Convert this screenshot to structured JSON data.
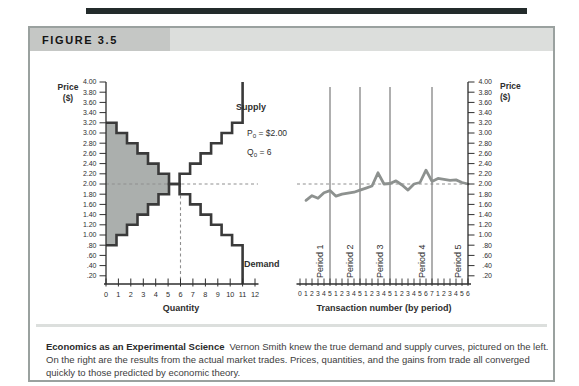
{
  "figure": {
    "label": "FIGURE 3.5",
    "caption_title": "Economics as an Experimental Science",
    "caption_body": "Vernon Smith knew the true demand and supply curves, pictured on the left. On the right are the results from the actual market trades. Prices, quantities, and the gains from trade all converged quickly to those predicted by economic theory."
  },
  "colors": {
    "top_bar": "#232b2b",
    "box_border": "#9aa19f",
    "tab_bg": "#c5c7c5",
    "header_bg": "#dcdedc",
    "surplus_fill": "#abafad",
    "curve": "#3a3a3a",
    "price_line": "#8d918f",
    "dashed": "#8f8f8f",
    "separator": "#7a7a7a",
    "axis": "#2f2f2f"
  },
  "chart_data": [
    {
      "type": "line",
      "subtype": "step-supply-demand",
      "panel": "left",
      "xlabel": "Quantity",
      "ylabel": "Price ($)",
      "xlim": [
        0,
        12
      ],
      "ylim": [
        0.2,
        4.0
      ],
      "grid": false,
      "xtick_labels": [
        "0",
        "1",
        "2",
        "3",
        "4",
        "5",
        "6",
        "7",
        "8",
        "9",
        "10",
        "11",
        "12"
      ],
      "ytick_labels": [
        "4.00",
        "3.80",
        "3.60",
        "3.40",
        "3.20",
        "3.00",
        "2.80",
        "2.60",
        "2.40",
        "2.20",
        "2.00",
        "1.80",
        "1.60",
        "1.40",
        "1.20",
        "1.00",
        ".80",
        ".60",
        ".40",
        ".20"
      ],
      "series": [
        {
          "name": "Demand",
          "style": "step",
          "x_start": 0,
          "x_end": 11,
          "unit_prices": [
            3.2,
            3.0,
            2.8,
            2.6,
            2.4,
            2.2,
            2.0,
            1.8,
            1.6,
            1.4,
            1.2,
            1.0,
            0.8
          ]
        },
        {
          "name": "Supply",
          "style": "step",
          "x_start": 0,
          "x_end": 11,
          "unit_prices": [
            0.8,
            1.0,
            1.2,
            1.4,
            1.6,
            1.8,
            2.0,
            2.2,
            2.4,
            2.6,
            2.8,
            3.0,
            3.2
          ]
        }
      ],
      "equilibrium": {
        "price": 2.0,
        "quantity": 6
      },
      "annotations": {
        "supply_label": "Supply",
        "demand_label": "Demand",
        "p0": {
          "base": "P",
          "sub": "0",
          "rest": " = $2.00"
        },
        "q0": {
          "base": "Q",
          "sub": "0",
          "rest": " = 6"
        }
      }
    },
    {
      "type": "line",
      "subtype": "transaction-prices",
      "panel": "right",
      "xlabel": "Transaction number (by period)",
      "ylabel": "Price ($)",
      "ylim": [
        0.2,
        4.0
      ],
      "equilibrium_price": 2.0,
      "ytick_labels": [
        "4.00",
        "3.80",
        "3.60",
        "3.40",
        "3.20",
        "3.00",
        "2.80",
        "2.60",
        "2.40",
        "2.20",
        "2.00",
        "1.80",
        "1.60",
        "1.40",
        "1.20",
        "1.00",
        ".80",
        ".60",
        ".40",
        ".20"
      ],
      "periods": [
        {
          "label": "Period 1",
          "tick_labels": [
            "0",
            "1",
            "2",
            "3",
            "4",
            "5"
          ],
          "prices": [
            1.68,
            1.77,
            1.72,
            1.83,
            1.87
          ]
        },
        {
          "label": "Period 2",
          "tick_labels": [
            "1",
            "2",
            "3",
            "4",
            "5"
          ],
          "prices": [
            1.76,
            1.8,
            1.82,
            1.84,
            1.88
          ]
        },
        {
          "label": "Period 3",
          "tick_labels": [
            "1",
            "2",
            "3",
            "4",
            "5"
          ],
          "prices": [
            1.92,
            1.96,
            2.22,
            2.0,
            2.01
          ]
        },
        {
          "label": "Period 4",
          "tick_labels": [
            "1",
            "2",
            "3",
            "4",
            "5",
            "6",
            "7"
          ],
          "prices": [
            2.06,
            1.98,
            1.88,
            2.0,
            2.03,
            2.27,
            2.05
          ]
        },
        {
          "label": "Period 5",
          "tick_labels": [
            "1",
            "2",
            "3",
            "4",
            "5",
            "6"
          ],
          "prices": [
            2.11,
            2.09,
            2.07,
            2.08,
            2.03,
            2.0
          ]
        }
      ]
    }
  ]
}
